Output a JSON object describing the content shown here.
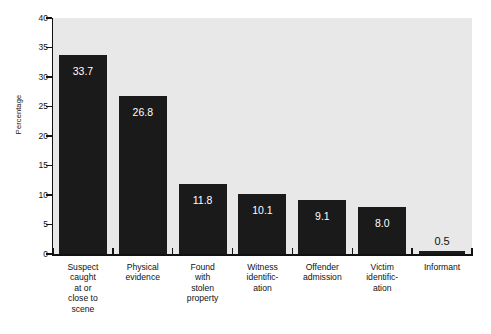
{
  "chart_data": {
    "type": "bar",
    "title": "",
    "xlabel": "",
    "ylabel": "Percentage",
    "ylim": [
      0,
      40
    ],
    "ytick_values": [
      0,
      5,
      10,
      15,
      20,
      25,
      30,
      35,
      40
    ],
    "ytick_labels": [
      "0",
      "5",
      "10",
      "15",
      "20",
      "25",
      "30",
      "35",
      "40"
    ],
    "grid": false,
    "legend": null,
    "orientation": "vertical",
    "categories": [
      "Suspect caught at or close to scene",
      "Physical evidence",
      "Found with stolen property",
      "Witness identification",
      "Offender admission",
      "Victim identification",
      "Informant"
    ],
    "category_lines": [
      [
        "Suspect",
        "caught",
        "at or",
        "close to",
        "scene"
      ],
      [
        "Physical",
        "evidence"
      ],
      [
        "Found",
        "with",
        "stolen",
        "property"
      ],
      [
        "Witness",
        "identific-",
        "ation"
      ],
      [
        "Offender",
        "admission"
      ],
      [
        "Victim",
        "identific-",
        "ation"
      ],
      [
        "Informant"
      ]
    ],
    "values": [
      33.7,
      26.8,
      11.8,
      10.1,
      9.1,
      8.0,
      0.5
    ],
    "value_labels": [
      "33.7",
      "26.8",
      "11.8",
      "10.1",
      "9.1",
      "8.0",
      "0.5"
    ],
    "label_placement": [
      "inside",
      "inside",
      "inside",
      "inside",
      "inside",
      "inside",
      "outside"
    ],
    "colors": {
      "bar": "#1a1a1a",
      "plot_background": "#e8e8e8",
      "page_background": "#ffffff",
      "axis": "#111111",
      "inside_label": "#ffffff",
      "outside_label": "#111111"
    }
  }
}
